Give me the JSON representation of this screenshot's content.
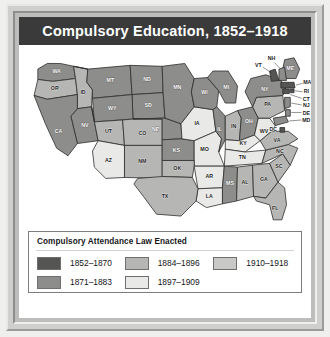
{
  "title": "Compulsory Education, 1852–1918",
  "legend": {
    "heading": "Compulsory Attendance Law Enacted",
    "columns": [
      [
        {
          "label": "1852–1870",
          "swatch": "s1",
          "color": "#555553"
        },
        {
          "label": "1871–1883",
          "swatch": "s2",
          "color": "#8d8d8b"
        }
      ],
      [
        {
          "label": "1884–1896",
          "swatch": "s3",
          "color": "#b6b6b4"
        },
        {
          "label": "1897–1909",
          "swatch": "s4",
          "color": "#e9e9e7"
        }
      ],
      [
        {
          "label": "1910–1918",
          "swatch": "s5",
          "color": "#c9c9c7"
        }
      ]
    ]
  },
  "map": {
    "states": [
      {
        "code": "WA",
        "class": "c2"
      },
      {
        "code": "OR",
        "class": "c3"
      },
      {
        "code": "ID",
        "class": "c3"
      },
      {
        "code": "MT",
        "class": "c2"
      },
      {
        "code": "ND",
        "class": "c2"
      },
      {
        "code": "SD",
        "class": "c2"
      },
      {
        "code": "WY",
        "class": "c2"
      },
      {
        "code": "NV",
        "class": "c2"
      },
      {
        "code": "CA",
        "class": "c2"
      },
      {
        "code": "UT",
        "class": "c3"
      },
      {
        "code": "CO",
        "class": "c3"
      },
      {
        "code": "AZ",
        "class": "c4"
      },
      {
        "code": "NM",
        "class": "c3"
      },
      {
        "code": "NE",
        "class": "c2"
      },
      {
        "code": "KS",
        "class": "c2"
      },
      {
        "code": "MN",
        "class": "c2"
      },
      {
        "code": "IA",
        "class": "c4"
      },
      {
        "code": "MO",
        "class": "c4"
      },
      {
        "code": "WI",
        "class": "c2"
      },
      {
        "code": "IL",
        "class": "c2"
      },
      {
        "code": "MI",
        "class": "c2"
      },
      {
        "code": "IN",
        "class": "c3"
      },
      {
        "code": "OH",
        "class": "c2"
      },
      {
        "code": "KY",
        "class": "c4"
      },
      {
        "code": "TN",
        "class": "c4"
      },
      {
        "code": "OK",
        "class": "c3"
      },
      {
        "code": "AR",
        "class": "c4"
      },
      {
        "code": "LA",
        "class": "c4"
      },
      {
        "code": "TX",
        "class": "c3"
      },
      {
        "code": "MS",
        "class": "c2"
      },
      {
        "code": "AL",
        "class": "c3"
      },
      {
        "code": "GA",
        "class": "c3"
      },
      {
        "code": "FL",
        "class": "c3"
      },
      {
        "code": "SC",
        "class": "c3"
      },
      {
        "code": "NC",
        "class": "c3"
      },
      {
        "code": "VA",
        "class": "c3"
      },
      {
        "code": "WV",
        "class": "c4"
      },
      {
        "code": "PA",
        "class": "c3"
      },
      {
        "code": "NY",
        "class": "c2"
      },
      {
        "code": "ME",
        "class": "c2"
      },
      {
        "code": "VT",
        "class": "c1"
      },
      {
        "code": "NH",
        "class": "c2"
      },
      {
        "code": "MA",
        "class": "c1"
      },
      {
        "code": "RI",
        "class": "c1"
      },
      {
        "code": "CT",
        "class": "c1"
      },
      {
        "code": "NJ",
        "class": "c2"
      },
      {
        "code": "DE",
        "class": "c2"
      },
      {
        "code": "MD",
        "class": "c2"
      },
      {
        "code": "DC",
        "class": "c1"
      }
    ],
    "outside_labels": [
      "NH",
      "VT",
      "MA",
      "RI",
      "CT",
      "NJ",
      "DE",
      "MD",
      "DC",
      "ME"
    ]
  }
}
